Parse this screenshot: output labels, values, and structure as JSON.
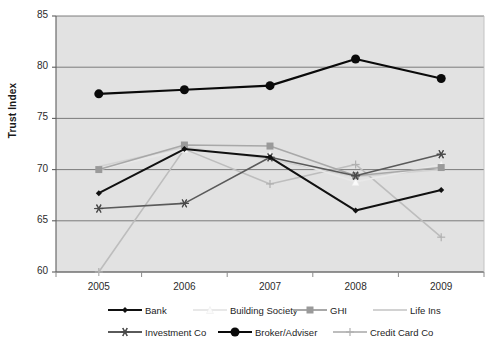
{
  "chart_data": {
    "type": "line",
    "title": "",
    "xlabel": "",
    "ylabel": "Trust Index",
    "categories": [
      "2005",
      "2006",
      "2007",
      "2008",
      "2009"
    ],
    "x": [
      2005,
      2006,
      2007,
      2008,
      2009
    ],
    "ylim": [
      60,
      85
    ],
    "yticks": [
      60,
      65,
      70,
      75,
      80,
      85
    ],
    "grid": true,
    "grid_axis": "y",
    "plot_background": "#e2e2e2",
    "legend_position": "bottom",
    "series": [
      {
        "name": "Bank",
        "values": [
          67.7,
          72.0,
          71.2,
          66.0,
          68.0
        ],
        "color": "#111111",
        "marker": "diamond",
        "marker_color": "#111111",
        "line_width": 2.0,
        "marker_size": 6
      },
      {
        "name": "Building Society",
        "values": [
          70.0,
          72.0,
          71.5,
          68.8,
          70.5
        ],
        "color": "#e8e8e8",
        "marker": "triangle",
        "marker_color": "#fbfbfb",
        "line_width": 1.6,
        "marker_size": 7
      },
      {
        "name": "GHI",
        "values": [
          70.0,
          72.4,
          72.3,
          69.4,
          70.2
        ],
        "color": "#a8a8a8",
        "marker": "square",
        "marker_color": "#9a9a9a",
        "line_width": 1.6,
        "marker_size": 7
      },
      {
        "name": "Life Ins",
        "values": [
          70.3,
          72.2,
          71.0,
          69.3,
          70.0
        ],
        "color": "#d2d2d2",
        "marker": "none",
        "marker_color": "#d2d2d2",
        "line_width": 1.5,
        "marker_size": 0
      },
      {
        "name": "Investment Co",
        "values": [
          66.2,
          66.7,
          71.2,
          69.4,
          71.5
        ],
        "color": "#5a5a5a",
        "marker": "asterisk",
        "marker_color": "#4a4a4a",
        "line_width": 1.6,
        "marker_size": 9
      },
      {
        "name": "Broker/Adviser",
        "values": [
          77.4,
          77.8,
          78.2,
          80.8,
          78.9
        ],
        "color": "#0a0a0a",
        "marker": "circle",
        "marker_color": "#0a0a0a",
        "line_width": 2.2,
        "marker_size": 9
      },
      {
        "name": "Credit Card Co",
        "values": [
          60.0,
          72.0,
          68.6,
          70.5,
          63.4
        ],
        "color": "#bdbdbd",
        "marker": "plus",
        "marker_color": "#b0b0b0",
        "line_width": 1.6,
        "marker_size": 8
      }
    ]
  },
  "axes": {
    "y_title": "Trust Index",
    "y_tick_labels": [
      "85",
      "80",
      "75",
      "70",
      "65",
      "60"
    ],
    "x_tick_labels": [
      "2005",
      "2006",
      "2007",
      "2008",
      "2009"
    ]
  },
  "legend": {
    "rows": [
      [
        {
          "label": "Bank",
          "series": "Bank"
        },
        {
          "label": "Building Society",
          "series": "Building Society"
        },
        {
          "label": "GHI",
          "series": "GHI"
        },
        {
          "label": "Life Ins",
          "series": "Life Ins"
        }
      ],
      [
        {
          "label": "Investment Co",
          "series": "Investment Co"
        },
        {
          "label": "Broker/Adviser",
          "series": "Broker/Adviser"
        },
        {
          "label": "Credit Card Co",
          "series": "Credit Card Co"
        }
      ]
    ]
  },
  "colors": {
    "plot_bg": "#e2e2e2",
    "plot_border": "#7d7d7d",
    "gridline": "#6f6f6f",
    "text": "#1d1d1d"
  }
}
